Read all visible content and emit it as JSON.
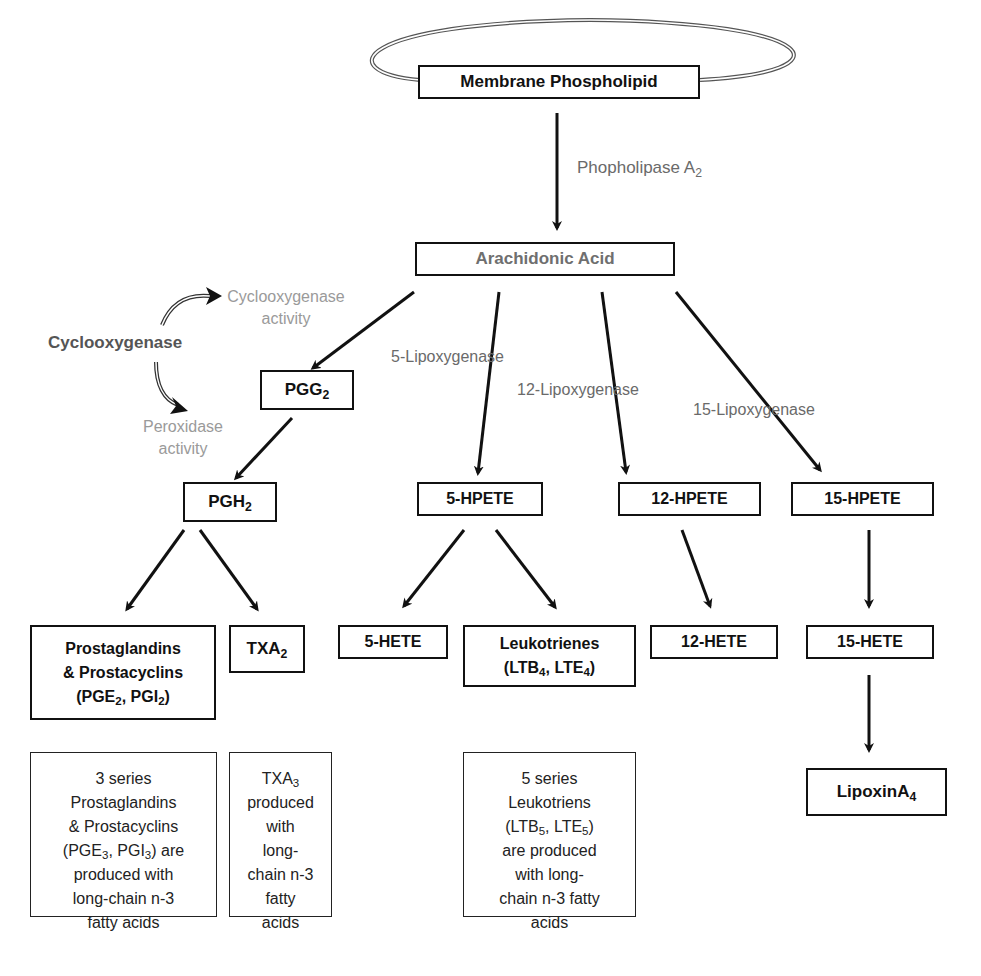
{
  "diagram": {
    "nodes": {
      "membrane": {
        "label": "Membrane Phospholipid"
      },
      "arachidonic": {
        "label": "Arachidonic Acid"
      },
      "pgg2": {
        "base": "PGG",
        "sub": "2"
      },
      "pgh2": {
        "base": "PGH",
        "sub": "2"
      },
      "hpete5": {
        "label": "5-HPETE"
      },
      "hpete12": {
        "label": "12-HPETE"
      },
      "hpete15": {
        "label": "15-HPETE"
      },
      "prostaglandins": {
        "line1": "Prostaglandins",
        "line2": "& Prostacyclins",
        "line3_a": "(PGE",
        "line3_sub1": "2",
        "line3_b": ", PGI",
        "line3_sub2": "2",
        "line3_c": ")"
      },
      "txa2": {
        "base": "TXA",
        "sub": "2"
      },
      "hete5": {
        "label": "5-HETE"
      },
      "leukotrienes": {
        "line1": "Leukotrienes",
        "line2_a": "(LTB",
        "line2_sub1": "4",
        "line2_b": ", LTE",
        "line2_sub2": "4",
        "line2_c": ")"
      },
      "hete12": {
        "label": "12-HETE"
      },
      "hete15": {
        "label": "15-HETE"
      },
      "lipoxin": {
        "base": "LipoxinA",
        "sub": "4"
      }
    },
    "enzymes": {
      "pla2": {
        "base": "Phopholipase A",
        "sub": "2"
      },
      "cyclooxygenase": "Cyclooxygenase",
      "cox_activity_line1": "Cyclooxygenase",
      "cox_activity_line2": "activity",
      "perox_activity_line1": "Peroxidase",
      "perox_activity_line2": "activity",
      "lox5": "5-Lipoxygenase",
      "lox12": "12-Lipoxygenase",
      "lox15": "15-Lipoxygenase"
    },
    "notes": {
      "series3": {
        "l1": "3 series",
        "l2": "Prostaglandins",
        "l3": "& Prostacyclins",
        "l4_a": "(PGE",
        "l4_sub1": "3",
        "l4_b": ", PGI",
        "l4_sub2": "3",
        "l4_c": ") are",
        "l5": "produced with",
        "l6": "long-chain n-3",
        "l7": "fatty acids"
      },
      "txa3": {
        "l1_a": "TXA",
        "l1_sub": "3",
        "l2": "produced",
        "l3": "with",
        "l4": "long-",
        "l5": "chain n-3",
        "l6": "fatty",
        "l7": "acids"
      },
      "series5": {
        "l1": "5 series",
        "l2": "Leukotriens",
        "l3_a": "(LTB",
        "l3_sub1": "5",
        "l3_b": ", LTE",
        "l3_sub2": "5",
        "l3_c": ")",
        "l4": "are produced",
        "l5": "with long-",
        "l6": "chain n-3 fatty",
        "l7": "acids"
      }
    },
    "colors": {
      "line": "#111111",
      "enzyme_text": "#6a6a6a",
      "activity_text": "#9a9a9a",
      "arachidonic_text": "#6f6f6f"
    }
  }
}
